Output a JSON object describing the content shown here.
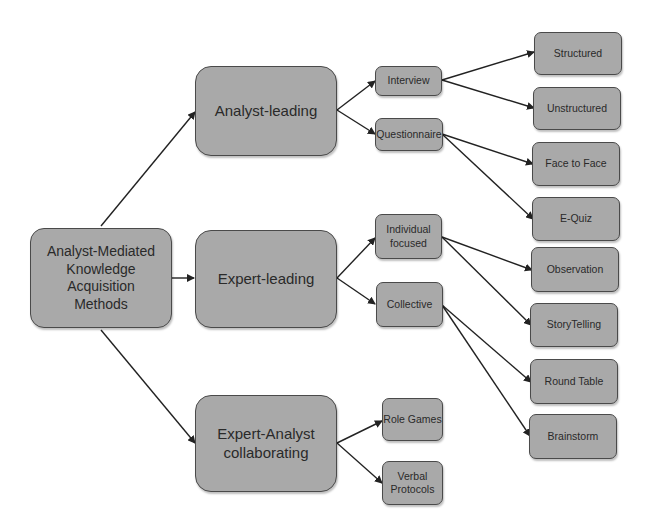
{
  "diagram": {
    "root": {
      "id": "root",
      "label": "Analyst-Mediated\nKnowledge\nAcquisition\nMethods"
    },
    "categories": [
      {
        "id": "analyst-leading",
        "label": "Analyst-leading"
      },
      {
        "id": "expert-leading",
        "label": "Expert-leading"
      },
      {
        "id": "expert-analyst",
        "label": "Expert-Analyst\ncollaborating"
      }
    ],
    "methods": [
      {
        "id": "interview",
        "label": "Interview",
        "parent": "analyst-leading"
      },
      {
        "id": "questionnaire",
        "label": "Questionnaire",
        "parent": "analyst-leading"
      },
      {
        "id": "individual",
        "label": "Individual\nfocused",
        "parent": "expert-leading"
      },
      {
        "id": "collective",
        "label": "Collective",
        "parent": "expert-leading"
      },
      {
        "id": "role-games",
        "label": "Role Games",
        "parent": "expert-analyst"
      },
      {
        "id": "verbal",
        "label": "Verbal\nProtocols",
        "parent": "expert-analyst"
      }
    ],
    "techniques": [
      {
        "id": "structured",
        "label": "Structured",
        "parent": "interview"
      },
      {
        "id": "unstructured",
        "label": "Unstructured",
        "parent": "interview"
      },
      {
        "id": "face",
        "label": "Face to Face",
        "parent": "questionnaire"
      },
      {
        "id": "equiz",
        "label": "E-Quiz",
        "parent": "questionnaire"
      },
      {
        "id": "observation",
        "label": "Observation",
        "parent": "individual"
      },
      {
        "id": "storytelling",
        "label": "StoryTelling",
        "parent": "individual"
      },
      {
        "id": "roundtable",
        "label": "Round Table",
        "parent": "collective"
      },
      {
        "id": "brainstorm",
        "label": "Brainstorm",
        "parent": "collective"
      }
    ]
  },
  "colors": {
    "node_fill": "#a9a9a9",
    "node_border": "#4a4a4a",
    "edge": "#222222",
    "text": "#2a2a2a"
  }
}
